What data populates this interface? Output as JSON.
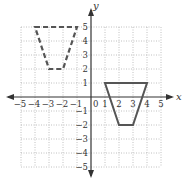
{
  "diagram": {
    "type": "coordinate-plane",
    "x_axis_label": "x",
    "y_axis_label": "y",
    "origin_label": "0",
    "x_range": [
      -5,
      5
    ],
    "y_range": [
      -5,
      5
    ],
    "x_tick_labels": [
      "−5",
      "−4",
      "−3",
      "−2",
      "−1",
      "1",
      "2",
      "3",
      "4",
      "5"
    ],
    "y_tick_labels": [
      "5",
      "4",
      "3",
      "2",
      "1",
      "−1",
      "−2",
      "−3",
      "−4",
      "−5"
    ],
    "colors": {
      "axis": "#333333",
      "grid": "#b0b0b0",
      "shape": "#555555"
    },
    "shapes": [
      {
        "name": "dashed-trapezoid",
        "style": "dashed",
        "vertices": [
          [
            -4,
            5
          ],
          [
            -1,
            5
          ],
          [
            -2,
            2
          ],
          [
            -3,
            2
          ]
        ]
      },
      {
        "name": "solid-trapezoid",
        "style": "solid",
        "vertices": [
          [
            1,
            1
          ],
          [
            4,
            1
          ],
          [
            3,
            -2
          ],
          [
            2,
            -2
          ]
        ]
      }
    ]
  }
}
